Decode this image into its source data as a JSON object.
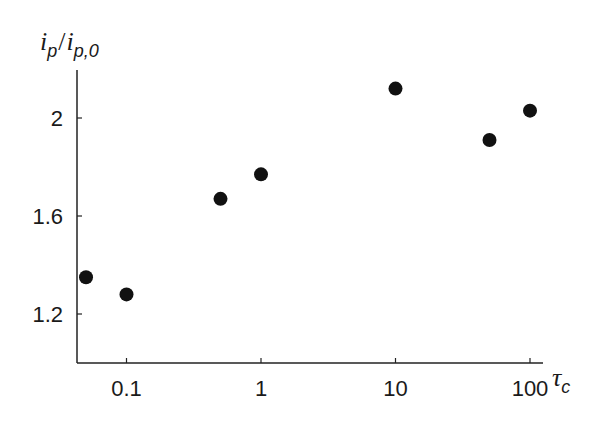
{
  "chart_data": {
    "type": "scatter",
    "title": "",
    "xlabel": "τ_c",
    "ylabel": "i_p/i_p,0",
    "xscale": "log",
    "xlim": [
      0.04,
      130
    ],
    "ylim": [
      1.0,
      2.2
    ],
    "xticks": [
      0.1,
      1,
      10,
      100
    ],
    "xtick_labels": [
      "0.1",
      "1",
      "10",
      "100"
    ],
    "yticks": [
      1.2,
      1.6,
      2.0
    ],
    "ytick_labels": [
      "1.2",
      "1.6",
      "2"
    ],
    "grid": false,
    "legend": null,
    "series": [
      {
        "name": "data",
        "marker": "filled-circle",
        "color": "#111111",
        "x": [
          0.05,
          0.1,
          0.5,
          1,
          10,
          50,
          100
        ],
        "y": [
          1.35,
          1.28,
          1.67,
          1.77,
          2.12,
          1.91,
          2.03
        ]
      }
    ]
  },
  "labels": {
    "y_main": "i",
    "y_sub1": "p",
    "y_slash": "/",
    "y_main2": "i",
    "y_sub2": "p,0",
    "x_main": "τ",
    "x_sub": "c"
  }
}
